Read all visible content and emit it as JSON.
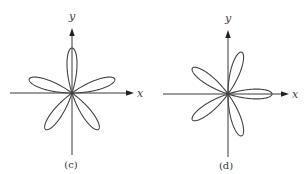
{
  "figure": {
    "panels": [
      {
        "id": "c",
        "label": "(c)",
        "x_axis_label": "x",
        "y_axis_label": "y",
        "equation_shape": "five-petal rose r = sin(5θ)",
        "petals": 5,
        "petal_angles_deg": [
          90,
          18,
          162,
          234,
          306
        ]
      },
      {
        "id": "d",
        "label": "(d)",
        "x_axis_label": "x",
        "y_axis_label": "y",
        "equation_shape": "five-petal rose r = cos(5θ)",
        "petals": 5,
        "petal_angles_deg": [
          0,
          72,
          144,
          216,
          288
        ]
      }
    ]
  },
  "colors": {
    "curve": "#444444",
    "axis": "#3a3a3a",
    "background": "#ffffff"
  }
}
